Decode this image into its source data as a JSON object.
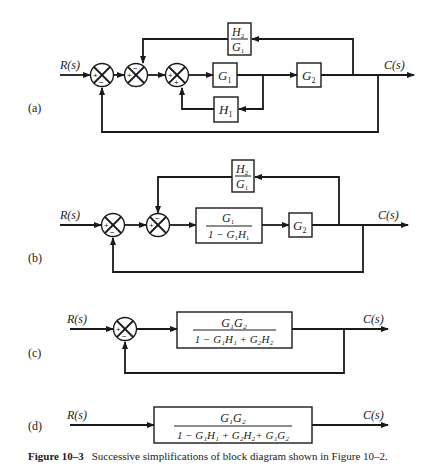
{
  "signals": {
    "input": "R(s)",
    "output": "C(s)"
  },
  "panels": {
    "a": {
      "label": "(a)",
      "blocks": {
        "g1": "G",
        "g1_sub": "1",
        "g2": "G",
        "g2_sub": "2",
        "h1": "H",
        "h1_sub": "1",
        "h2g1_num": "H",
        "h2g1_num_sub": "2",
        "h2g1_den": "G",
        "h2g1_den_sub": "1"
      },
      "junctions": [
        {
          "left": "+",
          "bottom": "−"
        },
        {
          "left": "+",
          "top": "−"
        },
        {
          "left": "+",
          "bottom": "+"
        }
      ]
    },
    "b": {
      "label": "(b)",
      "blocks": {
        "fwd_num": "G",
        "fwd_num_sub": "1",
        "fwd_den_a": "1 − G",
        "fwd_den_sub1": "1",
        "fwd_den_b": "H",
        "fwd_den_sub2": "1",
        "g2": "G",
        "g2_sub": "2",
        "h2g1_num": "H",
        "h2g1_num_sub": "2",
        "h2g1_den": "G",
        "h2g1_den_sub": "1"
      },
      "junctions": [
        {
          "left": "+",
          "bottom": "−"
        },
        {
          "left": "+",
          "top": "−"
        }
      ]
    },
    "c": {
      "label": "(c)",
      "block_num": "G₁G₂",
      "block_den": "1 − G₁H₁ + G₂H₂",
      "junctions": [
        {
          "left": "+",
          "bottom": "−"
        }
      ]
    },
    "d": {
      "label": "(d)",
      "block_num": "G₁G₂",
      "block_den": "1 − G₁H₁ + G₂H₂+ G₁G₂"
    }
  },
  "caption": {
    "label": "Figure 10–3",
    "text": "Successive simplifications of block diagram shown in Figure 10–2."
  }
}
